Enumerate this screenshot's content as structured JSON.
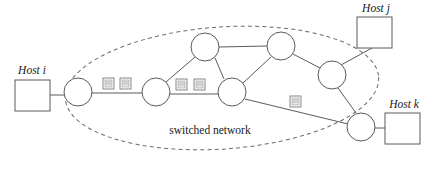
{
  "figure": {
    "canvas": {
      "width": 437,
      "height": 177
    },
    "background_color": "#ffffff",
    "line_color": "#5a5a5a",
    "dashed_color": "#6a6a6a"
  },
  "cloud": {
    "label": "switched network",
    "label_x": 210,
    "label_y": 134,
    "ellipse": {
      "cx": 222,
      "cy": 88,
      "rx": 157,
      "ry": 61,
      "rotation": -4
    }
  },
  "hosts": [
    {
      "id": "host-i",
      "label": "Host i",
      "label_x": 32,
      "label_y": 74,
      "box": {
        "x": 15,
        "y": 80,
        "w": 35,
        "h": 31
      }
    },
    {
      "id": "host-j",
      "label": "Host j",
      "label_x": 376,
      "label_y": 12,
      "box": {
        "x": 357,
        "y": 17,
        "w": 35,
        "h": 31
      }
    },
    {
      "id": "host-k",
      "label": "Host k",
      "label_x": 404,
      "label_y": 108,
      "box": {
        "x": 385,
        "y": 113,
        "w": 35,
        "h": 31
      }
    }
  ],
  "switches": [
    {
      "id": "s1",
      "cx": 78,
      "cy": 92,
      "r": 14
    },
    {
      "id": "s2",
      "cx": 156,
      "cy": 92,
      "r": 14
    },
    {
      "id": "s3",
      "cx": 205,
      "cy": 47,
      "r": 14
    },
    {
      "id": "s4",
      "cx": 232,
      "cy": 92,
      "r": 14
    },
    {
      "id": "s5",
      "cx": 281,
      "cy": 46,
      "r": 14
    },
    {
      "id": "s6",
      "cx": 332,
      "cy": 75,
      "r": 14
    },
    {
      "id": "s7",
      "cx": 361,
      "cy": 127,
      "r": 14
    }
  ],
  "links": [
    {
      "from": "host-i",
      "to": "s1",
      "x1": 50,
      "y1": 95,
      "x2": 64,
      "y2": 95
    },
    {
      "from": "s1",
      "to": "s2",
      "x1": 92,
      "y1": 93,
      "x2": 142,
      "y2": 93
    },
    {
      "from": "s2",
      "to": "s3",
      "x1": 166,
      "y1": 82,
      "x2": 195,
      "y2": 57
    },
    {
      "from": "s2",
      "to": "s4",
      "x1": 170,
      "y1": 94,
      "x2": 218,
      "y2": 94
    },
    {
      "from": "s3",
      "to": "s5",
      "x1": 219,
      "y1": 47,
      "x2": 267,
      "y2": 46
    },
    {
      "from": "s3",
      "to": "s4",
      "x1": 215,
      "y1": 58,
      "x2": 223,
      "y2": 79
    },
    {
      "from": "s5",
      "to": "s4",
      "x1": 271,
      "y1": 57,
      "x2": 243,
      "y2": 83
    },
    {
      "from": "s5",
      "to": "s6",
      "x1": 293,
      "y1": 54,
      "x2": 320,
      "y2": 68
    },
    {
      "from": "s6",
      "to": "s7",
      "x1": 338,
      "y1": 88,
      "x2": 356,
      "y2": 113
    },
    {
      "from": "s6",
      "to": "host-j",
      "x1": 341,
      "y1": 65,
      "x2": 372,
      "y2": 48
    },
    {
      "from": "s4",
      "to": "s7",
      "x1": 245,
      "y1": 99,
      "x2": 348,
      "y2": 124
    },
    {
      "from": "s7",
      "to": "host-k",
      "x1": 375,
      "y1": 128,
      "x2": 385,
      "y2": 128
    }
  ],
  "packets": [
    {
      "id": "pkt-1",
      "x": 103,
      "y": 78,
      "w": 11,
      "h": 11,
      "on_link": "s1-s2"
    },
    {
      "id": "pkt-2",
      "x": 120,
      "y": 78,
      "w": 11,
      "h": 11,
      "on_link": "s1-s2"
    },
    {
      "id": "pkt-3",
      "x": 176,
      "y": 79,
      "w": 11,
      "h": 11,
      "on_link": "s2-s4"
    },
    {
      "id": "pkt-4",
      "x": 194,
      "y": 79,
      "w": 11,
      "h": 11,
      "on_link": "s2-s4"
    },
    {
      "id": "pkt-5",
      "x": 290,
      "y": 96,
      "w": 11,
      "h": 11,
      "on_link": "s4-s7"
    }
  ]
}
